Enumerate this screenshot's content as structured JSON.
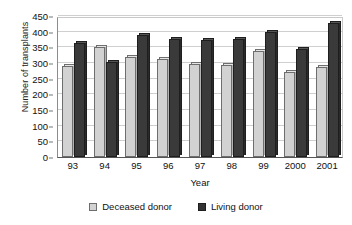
{
  "chart_data": {
    "type": "bar",
    "title": "",
    "xlabel": "Year",
    "ylabel": "Number of transplants",
    "categories": [
      "93",
      "94",
      "95",
      "96",
      "97",
      "98",
      "99",
      "2000",
      "2001"
    ],
    "series": [
      {
        "name": "Deceased donor",
        "color": "#d2d2d2",
        "values": [
          290,
          350,
          318,
          312,
          298,
          295,
          337,
          272,
          288
        ]
      },
      {
        "name": "Living donor",
        "color": "#333333",
        "values": [
          365,
          303,
          390,
          378,
          375,
          378,
          400,
          345,
          428
        ]
      }
    ],
    "ylim": [
      0,
      450
    ],
    "yticks": [
      0,
      50,
      100,
      150,
      200,
      250,
      300,
      350,
      400,
      450
    ],
    "ytick_labels": [
      "0",
      "50",
      "100",
      "150",
      "200",
      "250",
      "300",
      "350",
      "400",
      "450"
    ],
    "grid": true,
    "legend_position": "bottom"
  }
}
